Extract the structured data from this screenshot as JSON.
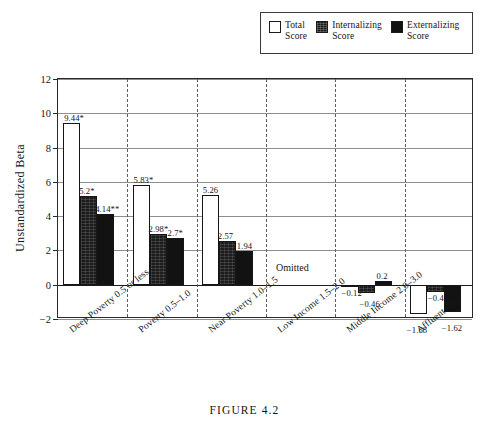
{
  "figure": {
    "caption": "FIGURE 4.2"
  },
  "legend": {
    "items": [
      {
        "name": "total-score",
        "label": "Total\nScore",
        "swatch": "white-square",
        "color": "#ffffff"
      },
      {
        "name": "internalizing-score",
        "label": "Internalizing\nScore",
        "swatch": "dark-textured-square",
        "color": "#1d1d1d"
      },
      {
        "name": "externalizing-score",
        "label": "Externalizing\nScore",
        "swatch": "black-square",
        "color": "#111111"
      }
    ]
  },
  "chart_data": {
    "type": "bar",
    "title": "",
    "xlabel": "",
    "ylabel": "Unstandardized Beta",
    "ylim": [
      -2,
      12
    ],
    "yticks": [
      -2,
      0,
      2,
      4,
      6,
      8,
      10,
      12
    ],
    "ytick_labels": [
      "−2",
      "0",
      "2",
      "4",
      "6",
      "8",
      "10",
      "12"
    ],
    "grid": true,
    "legend_position": "top-right",
    "categories": [
      "Deep Poverty 0.5 or less",
      "Poverty 0.5–1.0",
      "Near Poverty 1.0–1.5",
      "Low Income 1.5–2.0",
      "Middle Income 2.0–3.0",
      "Affluent 3.0+"
    ],
    "series": [
      {
        "name": "Total Score",
        "values": [
          9.44,
          5.83,
          5.26,
          null,
          -0.12,
          -1.68
        ],
        "labels": [
          "9.44*",
          "5.83*",
          "5.26",
          "",
          "−0.12",
          "−1.68"
        ]
      },
      {
        "name": "Internalizing Score",
        "values": [
          5.2,
          2.98,
          2.57,
          null,
          -0.46,
          -0.43
        ],
        "labels": [
          "5.2*",
          "2.98*",
          "2.57",
          "",
          "−0.46",
          "−0.43"
        ]
      },
      {
        "name": "Externalizing Score",
        "values": [
          4.14,
          2.7,
          1.94,
          null,
          0.2,
          -1.62
        ],
        "labels": [
          "4.14**",
          "2.7*",
          "1.94",
          "",
          "0.2",
          "−1.62"
        ]
      }
    ],
    "annotations": [
      {
        "text": "Omitted",
        "category": "Low Income 1.5–2.0",
        "value": 0.9
      }
    ]
  }
}
